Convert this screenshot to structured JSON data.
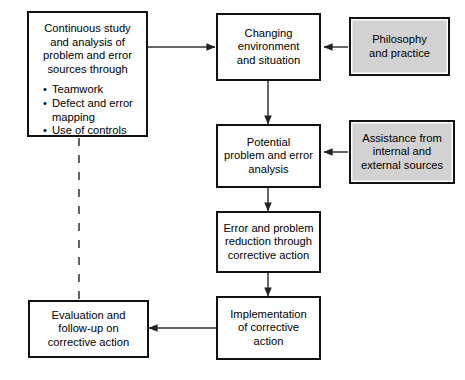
{
  "diagram": {
    "background_color": "#ffffff",
    "line_color": "#333333",
    "box_border_color": "#111111",
    "shaded_fill_color": "#d2d2d2",
    "nodes": [
      {
        "id": "continuous-study",
        "heading_lines": [
          "Continuous study",
          "and analysis of",
          "problem and error",
          "sources through"
        ],
        "bullets": [
          "Teamwork",
          "Defect and error mapping",
          "Use of controls"
        ],
        "shaded": false
      },
      {
        "id": "changing-environment",
        "lines": [
          "Changing",
          "environment",
          "and situation"
        ],
        "shaded": false
      },
      {
        "id": "philosophy-and-practice",
        "lines": [
          "Philosophy",
          "and practice"
        ],
        "shaded": true
      },
      {
        "id": "potential-problem-analysis",
        "lines": [
          "Potential",
          "problem and error",
          "analysis"
        ],
        "shaded": false
      },
      {
        "id": "assistance-from-sources",
        "lines": [
          "Assistance from",
          "internal and",
          "external sources"
        ],
        "shaded": true
      },
      {
        "id": "error-reduction",
        "lines": [
          "Error and problem",
          "reduction through",
          "corrective action"
        ],
        "shaded": false
      },
      {
        "id": "implementation",
        "lines": [
          "Implementation",
          "of corrective",
          "action"
        ],
        "shaded": false
      },
      {
        "id": "evaluation",
        "lines": [
          "Evaluation and",
          "follow-up on",
          "corrective action"
        ],
        "shaded": false
      }
    ],
    "connectors": [
      {
        "from": "continuous-study",
        "to": "changing-environment",
        "style": "solid-arrow",
        "direction": "right"
      },
      {
        "from": "philosophy-and-practice",
        "to": "changing-environment",
        "style": "solid-arrow",
        "direction": "left"
      },
      {
        "from": "changing-environment",
        "to": "potential-problem-analysis",
        "style": "solid-arrow",
        "direction": "down"
      },
      {
        "from": "assistance-from-sources",
        "to": "potential-problem-analysis",
        "style": "solid-arrow",
        "direction": "left"
      },
      {
        "from": "potential-problem-analysis",
        "to": "error-reduction",
        "style": "solid-arrow",
        "direction": "down"
      },
      {
        "from": "error-reduction",
        "to": "implementation",
        "style": "solid-arrow",
        "direction": "down"
      },
      {
        "from": "implementation",
        "to": "evaluation",
        "style": "solid-arrow",
        "direction": "left"
      },
      {
        "from": "continuous-study",
        "to": "evaluation",
        "style": "dashed-line",
        "direction": "down"
      }
    ]
  }
}
